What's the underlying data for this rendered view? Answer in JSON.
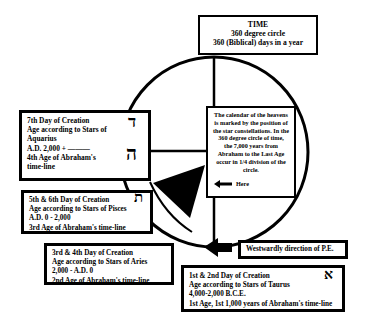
{
  "title_box": {
    "heading": "TIME",
    "line1": "360 degree circle",
    "line2": "360 (Biblical) days in a year"
  },
  "info_box": {
    "lines": [
      "The calendar of the heavens",
      "is marked by the position of",
      "the star constellations.  In the",
      "360 degree circle of  time,",
      "the 7,000 years from",
      "Abraham to the Last Age",
      "occur in 1/4 division of the",
      "circle."
    ],
    "here_label": "Here",
    "here_icon": "arrow-left-icon"
  },
  "age_boxes": {
    "seventh": {
      "lines": [
        "7th Day of Creation",
        "Age according to Stars of",
        "Aquarius",
        "A.D. 2,000 + ———",
        "4th Age of Abraham's",
        "time-line"
      ],
      "hebrew_top": "ד",
      "hebrew_bottom": "ה"
    },
    "fifth_sixth": {
      "lines": [
        "5th & 6th Day of Creation",
        "Age according to Stars of  Pisces",
        "A.D. 0 - 2,000",
        "3rd Age of Abraham's time-line"
      ],
      "hebrew": "ת"
    },
    "third_fourth": {
      "lines": [
        "3rd & 4th Day of Creation",
        "Age according to Stars of  Aries",
        "2,000 - A.D. 0",
        "2nd Age of Abraham's time-line"
      ]
    },
    "first_second": {
      "lines": [
        "1st & 2nd Day of Creation",
        "Age according to Stars of Taurus",
        "4,000-2,000 B.C.E.",
        "1st Age, 1st 1,000 years of Abraham's time-line"
      ],
      "hebrew": "א"
    }
  },
  "direction_box": {
    "label": "Westwardly direction of P.E.",
    "icon": "arrow-left-icon"
  },
  "colors": {
    "ink": "#000000",
    "paper": "#ffffff"
  }
}
